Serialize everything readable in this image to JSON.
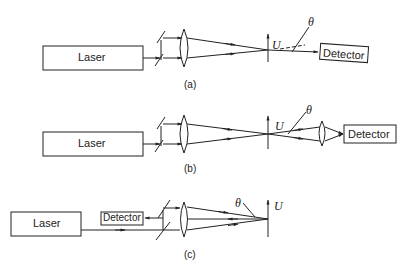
{
  "figure": {
    "panels": [
      {
        "caption": "(a)",
        "laser_label": "Laser",
        "detector_label": "Detector",
        "object_label": "U",
        "angle_label": "θ"
      },
      {
        "caption": "(b)",
        "laser_label": "Laser",
        "detector_label": "Detector",
        "object_label": "U",
        "angle_label": "θ"
      },
      {
        "caption": "(c)",
        "laser_label": "Laser",
        "detector_label": "Detector",
        "object_label": "U",
        "angle_label": "θ"
      }
    ],
    "colors": {
      "line": "#222222",
      "background": "#ffffff"
    }
  }
}
